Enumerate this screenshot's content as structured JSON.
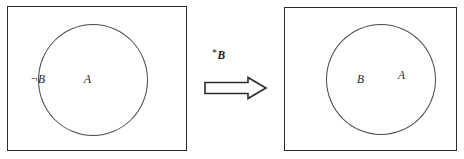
{
  "figure": {
    "type": "belief-revision-diagram",
    "background_color": "#ffffff",
    "line_color": "#2b2b2b",
    "circle_color": "#4a4a4a",
    "text_color": "#1c1c1c"
  },
  "panel_before": {
    "name": "before-revision",
    "circle": {
      "labels": {
        "negated_b": "¬B",
        "a": "A"
      }
    }
  },
  "arrow": {
    "operator_label": "*B",
    "operator_star": "*",
    "operator_operand": "B",
    "direction": "right",
    "style": "hollow-block-arrow"
  },
  "panel_after": {
    "name": "after-revision",
    "circle": {
      "labels": {
        "b": "B",
        "a": "A"
      }
    }
  }
}
